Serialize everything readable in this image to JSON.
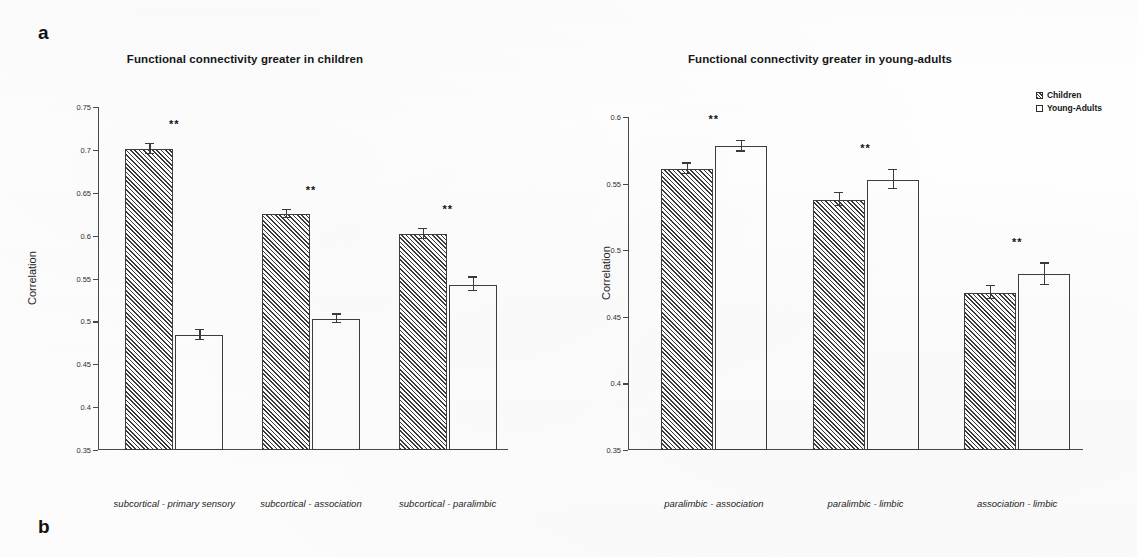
{
  "figure": {
    "panel_a_label": "a",
    "panel_b_label": "b"
  },
  "legend": {
    "series": [
      {
        "name": "Children",
        "marker": "hatched-square-swatch"
      },
      {
        "name": "Young-Adults",
        "marker": "empty-square-swatch"
      }
    ]
  },
  "chart_data": [
    {
      "id": "children-greater",
      "type": "bar",
      "title": "Functional connectivity greater in children",
      "xlabel": "",
      "ylabel": "Correlation",
      "ylim": [
        0.35,
        0.75
      ],
      "yticks": [
        0.35,
        0.4,
        0.45,
        0.5,
        0.55,
        0.6,
        0.65,
        0.7,
        0.75
      ],
      "ytick_labels": [
        "0.35",
        "0.4",
        "0.45",
        "0.5",
        "0.55",
        "0.6",
        "0.65",
        "0.7",
        "0.75"
      ],
      "grid": false,
      "legend_position": "none",
      "categories": [
        "subcortical - primary sensory",
        "subcortical - association",
        "subcortical - paralimbic"
      ],
      "series": [
        {
          "name": "Children",
          "values": [
            0.701,
            0.625,
            0.602
          ],
          "errors": [
            0.006,
            0.005,
            0.006
          ]
        },
        {
          "name": "Young-Adults",
          "values": [
            0.484,
            0.503,
            0.543
          ],
          "errors": [
            0.006,
            0.005,
            0.008
          ]
        }
      ],
      "annotations": [
        "**",
        "**",
        "**"
      ]
    },
    {
      "id": "young-adults-greater",
      "type": "bar",
      "title": "Functional connectivity greater in young-adults",
      "xlabel": "",
      "ylabel": "Correlation",
      "ylim": [
        0.35,
        0.6
      ],
      "yticks": [
        0.35,
        0.4,
        0.45,
        0.5,
        0.55,
        0.6
      ],
      "ytick_labels": [
        "0.35",
        "0.4",
        "0.45",
        "0.5",
        "0.55",
        "0.6"
      ],
      "grid": false,
      "legend_position": "top-right",
      "categories": [
        "paralimbic - association",
        "paralimbic - limbic",
        "association - limbic"
      ],
      "series": [
        {
          "name": "Children",
          "values": [
            0.561,
            0.538,
            0.468
          ],
          "errors": [
            0.004,
            0.005,
            0.005
          ]
        },
        {
          "name": "Young-Adults",
          "values": [
            0.578,
            0.553,
            0.482
          ],
          "errors": [
            0.004,
            0.007,
            0.008
          ]
        }
      ],
      "annotations": [
        "**",
        "**",
        "**"
      ]
    }
  ],
  "colors": {
    "axis": "#4a4a4a",
    "bar_edge": "#3d3d3d",
    "hatch": "#3a3a3a",
    "background": "#ffffff"
  }
}
